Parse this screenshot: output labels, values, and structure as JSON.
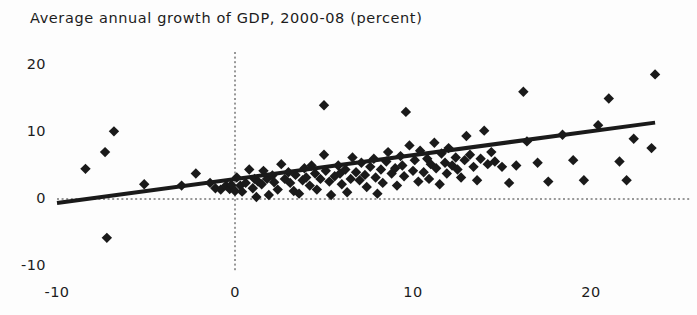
{
  "chart_data": {
    "type": "scatter",
    "title": "Average annual growth of GDP, 2000-08 (percent)",
    "xlabel": "",
    "ylabel": "",
    "xlim": [
      -10,
      26
    ],
    "ylim": [
      -10,
      22
    ],
    "xticks": [
      -10,
      0,
      10,
      20
    ],
    "xtick_labels": [
      "-10",
      "0",
      "10",
      "20"
    ],
    "yticks": [
      -10,
      0,
      10,
      20
    ],
    "ytick_labels": [
      "-10",
      "0",
      "10",
      "20"
    ],
    "grid": false,
    "reference_lines": [
      {
        "name": "x-zero-line",
        "axis": "vertical",
        "value": 0,
        "style": "dotted"
      },
      {
        "name": "y-zero-line",
        "axis": "horizontal",
        "value": 0,
        "style": "dotted"
      }
    ],
    "trendline": {
      "name": "linear-fit",
      "x": [
        -10,
        23.6
      ],
      "y": [
        -0.6,
        11.4
      ],
      "slope": 0.357,
      "intercept": 2.97,
      "color": "#1a1a1a",
      "width": 4
    },
    "marker": {
      "shape": "diamond",
      "color": "#1a1a1a",
      "size": 8
    },
    "points": [
      [
        -8.4,
        4.5
      ],
      [
        -7.3,
        7.0
      ],
      [
        -6.8,
        10.1
      ],
      [
        -7.2,
        -5.8
      ],
      [
        -5.1,
        2.2
      ],
      [
        -3.0,
        2.0
      ],
      [
        -2.2,
        3.8
      ],
      [
        -1.4,
        2.4
      ],
      [
        -1.1,
        1.6
      ],
      [
        -0.8,
        1.4
      ],
      [
        -0.5,
        2.0
      ],
      [
        -0.3,
        1.5
      ],
      [
        -0.2,
        2.1
      ],
      [
        0.0,
        1.2
      ],
      [
        0.1,
        3.2
      ],
      [
        0.3,
        2.0
      ],
      [
        0.4,
        1.1
      ],
      [
        0.6,
        2.4
      ],
      [
        0.8,
        4.4
      ],
      [
        1.0,
        1.6
      ],
      [
        1.1,
        3.0
      ],
      [
        1.3,
        2.6
      ],
      [
        1.5,
        2.2
      ],
      [
        1.6,
        4.2
      ],
      [
        1.8,
        3.0
      ],
      [
        1.2,
        0.3
      ],
      [
        1.9,
        0.6
      ],
      [
        2.1,
        3.5
      ],
      [
        2.2,
        2.5
      ],
      [
        2.4,
        1.4
      ],
      [
        2.6,
        5.2
      ],
      [
        2.8,
        3.0
      ],
      [
        3.0,
        4.0
      ],
      [
        3.1,
        2.4
      ],
      [
        3.3,
        1.2
      ],
      [
        3.4,
        3.6
      ],
      [
        3.6,
        0.8
      ],
      [
        3.8,
        2.8
      ],
      [
        3.9,
        4.6
      ],
      [
        4.0,
        3.2
      ],
      [
        4.2,
        2.0
      ],
      [
        4.3,
        5.0
      ],
      [
        4.5,
        3.8
      ],
      [
        4.6,
        1.4
      ],
      [
        4.8,
        3.0
      ],
      [
        5.0,
        14.0
      ],
      [
        5.0,
        6.6
      ],
      [
        5.1,
        4.2
      ],
      [
        5.3,
        2.6
      ],
      [
        5.4,
        0.6
      ],
      [
        5.6,
        3.4
      ],
      [
        5.8,
        5.0
      ],
      [
        5.9,
        3.8
      ],
      [
        6.0,
        2.2
      ],
      [
        6.2,
        4.4
      ],
      [
        6.3,
        1.0
      ],
      [
        6.5,
        3.0
      ],
      [
        6.6,
        6.2
      ],
      [
        6.8,
        4.0
      ],
      [
        7.0,
        2.8
      ],
      [
        7.1,
        5.4
      ],
      [
        7.3,
        3.6
      ],
      [
        7.4,
        1.8
      ],
      [
        7.6,
        4.8
      ],
      [
        7.8,
        6.0
      ],
      [
        7.9,
        3.2
      ],
      [
        8.0,
        0.8
      ],
      [
        8.2,
        4.4
      ],
      [
        8.3,
        2.4
      ],
      [
        8.5,
        5.6
      ],
      [
        8.6,
        7.0
      ],
      [
        8.8,
        3.8
      ],
      [
        9.0,
        4.6
      ],
      [
        9.1,
        2.0
      ],
      [
        9.3,
        6.4
      ],
      [
        9.4,
        5.0
      ],
      [
        9.5,
        3.4
      ],
      [
        9.6,
        13.0
      ],
      [
        9.8,
        8.0
      ],
      [
        10.0,
        4.2
      ],
      [
        10.1,
        5.8
      ],
      [
        10.3,
        2.6
      ],
      [
        10.4,
        7.2
      ],
      [
        10.6,
        4.0
      ],
      [
        10.8,
        6.0
      ],
      [
        10.9,
        3.0
      ],
      [
        11.0,
        5.2
      ],
      [
        11.2,
        8.4
      ],
      [
        11.3,
        4.6
      ],
      [
        11.5,
        2.2
      ],
      [
        11.6,
        6.8
      ],
      [
        11.8,
        5.4
      ],
      [
        11.9,
        3.8
      ],
      [
        12.0,
        7.6
      ],
      [
        12.2,
        5.0
      ],
      [
        12.4,
        6.2
      ],
      [
        12.5,
        4.4
      ],
      [
        12.7,
        3.2
      ],
      [
        12.9,
        5.8
      ],
      [
        13.0,
        9.4
      ],
      [
        13.2,
        6.6
      ],
      [
        13.4,
        4.8
      ],
      [
        13.6,
        2.8
      ],
      [
        13.8,
        6.0
      ],
      [
        14.0,
        10.2
      ],
      [
        14.2,
        5.2
      ],
      [
        14.4,
        7.0
      ],
      [
        14.6,
        5.6
      ],
      [
        15.0,
        4.8
      ],
      [
        15.4,
        2.4
      ],
      [
        15.8,
        5.0
      ],
      [
        16.2,
        16.0
      ],
      [
        16.4,
        8.6
      ],
      [
        17.0,
        5.4
      ],
      [
        17.6,
        2.6
      ],
      [
        18.4,
        9.6
      ],
      [
        19.0,
        5.8
      ],
      [
        19.6,
        2.8
      ],
      [
        20.4,
        11.0
      ],
      [
        21.0,
        15.0
      ],
      [
        21.6,
        5.6
      ],
      [
        22.0,
        2.8
      ],
      [
        22.4,
        9.0
      ],
      [
        23.6,
        18.6
      ],
      [
        23.4,
        7.6
      ]
    ]
  }
}
